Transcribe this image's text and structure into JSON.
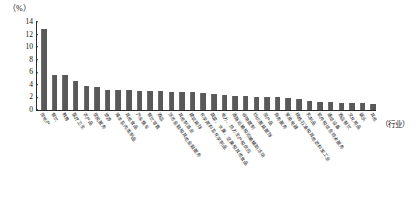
{
  "chart_data": {
    "type": "bar",
    "title": "",
    "subtitle": "",
    "unit_label": "（%）",
    "xlabel": "（行业）",
    "ylabel": "",
    "ylim": [
      0,
      14
    ],
    "yticks": [
      0,
      2,
      4,
      6,
      8,
      10,
      12,
      14
    ],
    "grid": false,
    "legend": null,
    "bar_color": "#595959",
    "axis_color": "#2b2b2b",
    "categories": [
      "房地产",
      "餐饮",
      "教育",
      "医疗卫生",
      "农产品",
      "居民服务",
      "旅游",
      "猪羊及肉类制品",
      "其他食品",
      "汽车整车",
      "餐饮零售",
      "酒店",
      "货币金融和其他金融服务",
      "其他制造业",
      "建筑装饰",
      "化学原料及化学制品",
      "蔬菜、水果、坚果和其他食品",
      "电力、热力生产和供应",
      "道路运输和运输辅助活动",
      "谷物磨制",
      "纺织服装服饰",
      "房产品",
      "商务服务",
      "家用电器",
      "精炼石油和其他燃料加工业",
      "乳制品",
      "软件和信息技术服务",
      "通信设备",
      "酒店餐饮",
      "文化用品",
      "娱乐",
      "其他"
    ],
    "values": [
      12.9,
      5.6,
      5.5,
      4.6,
      3.8,
      3.65,
      3.2,
      3.2,
      3.15,
      3.05,
      3.0,
      2.95,
      2.9,
      2.85,
      2.8,
      2.75,
      2.6,
      2.45,
      2.3,
      2.2,
      2.1,
      2.05,
      2.0,
      1.95,
      1.8,
      1.45,
      1.25,
      1.2,
      1.15,
      1.1,
      1.05,
      1.0
    ]
  }
}
